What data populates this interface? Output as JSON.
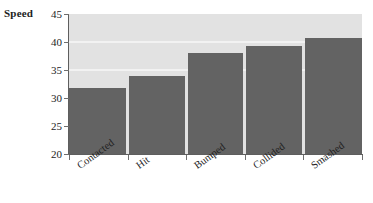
{
  "chart_data": {
    "type": "bar",
    "title": "",
    "subtitle": "",
    "xlabel": "",
    "ylabel": "Speed",
    "categories": [
      "Contacted",
      "Hit",
      "Bumped",
      "Collided",
      "Smashed"
    ],
    "values": [
      31.8,
      34.0,
      38.0,
      39.3,
      40.8
    ],
    "series": [
      {
        "name": "Speed",
        "values": [
          31.8,
          34.0,
          38.0,
          39.3,
          40.8
        ]
      }
    ],
    "ylim": [
      20,
      45
    ],
    "ytick_labels": [
      "45",
      "40",
      "35",
      "30",
      "25",
      "20"
    ],
    "ytick_values": [
      45,
      40,
      35,
      30,
      25,
      20
    ],
    "xtick_labels": [
      "Contacted",
      "Hit",
      "Bumped",
      "Collided",
      "Smashed"
    ],
    "grid": true,
    "gridlines_at": [
      40,
      35
    ],
    "legend": null,
    "legend_position": "none",
    "annotations": [],
    "x_label_rotation_degrees": -36,
    "colors": {
      "bar_fill": "#636363",
      "plot_background": "#e2e2e2",
      "gridline": "#f2f2f2",
      "axis_line": "#5e5e5e",
      "tick_mark": "#6e6e6e",
      "text": "#1d1d1d",
      "figure_background": "#ffffff"
    }
  },
  "axis": {
    "y_title": "Speed"
  }
}
